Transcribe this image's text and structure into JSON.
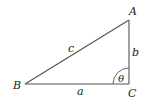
{
  "diagram": {
    "type": "right-triangle",
    "vertices": {
      "A": {
        "label": "A",
        "x": 129,
        "y": 20
      },
      "B": {
        "label": "B",
        "x": 25,
        "y": 84
      },
      "C": {
        "label": "C",
        "x": 129,
        "y": 84
      }
    },
    "sides": {
      "a": {
        "label": "a",
        "between": "B-C"
      },
      "b": {
        "label": "b",
        "between": "C-A"
      },
      "c": {
        "label": "c",
        "between": "B-A"
      }
    },
    "angle": {
      "label": "θ",
      "at": "C"
    },
    "colors": {
      "line": "#555555",
      "text": "#222222",
      "background": "#ffffff"
    }
  }
}
